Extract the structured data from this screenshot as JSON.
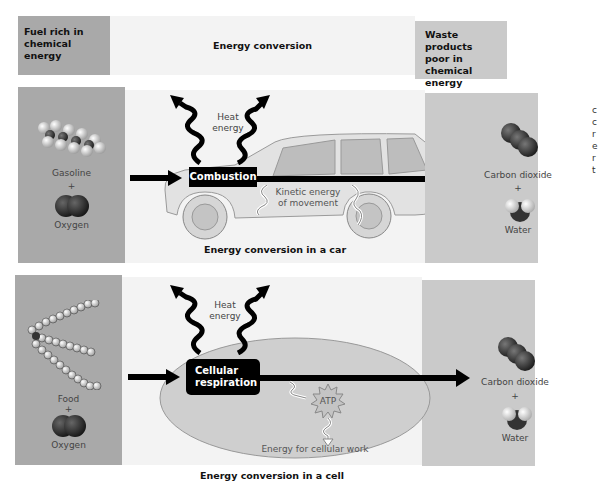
{
  "header": {
    "left": "Fuel rich in chemical energy",
    "left_lines": [
      "Fuel rich in",
      "chemical",
      "energy"
    ],
    "middle": "Energy conversion",
    "right": "Waste products poor in chemical energy",
    "right_lines": [
      "Waste products",
      "poor in chemical",
      "energy"
    ]
  },
  "car_panel": {
    "inputs": {
      "fuel": "Gasoline",
      "plus": "+",
      "oxidant": "Oxygen"
    },
    "heat_label": [
      "Heat",
      "energy"
    ],
    "process": "Combustion",
    "kinetic_label": [
      "Kinetic energy",
      "of movement"
    ],
    "caption": "Energy conversion in a car",
    "outputs": {
      "product1": "Carbon dioxide",
      "plus": "+",
      "product2": "Water"
    }
  },
  "cell_panel": {
    "inputs": {
      "fuel": "Food",
      "plus": "+",
      "oxidant": "Oxygen"
    },
    "heat_label": [
      "Heat",
      "energy"
    ],
    "process": [
      "Cellular",
      "respiration"
    ],
    "atp_label": "ATP",
    "work_label": "Energy for cellular work",
    "caption": "Energy conversion in a cell",
    "outputs": {
      "product1": "Carbon dioxide",
      "plus": "+",
      "product2": "Water"
    }
  },
  "edge_text": [
    "c",
    "c",
    "r",
    "e",
    "r",
    "t"
  ],
  "colors": {
    "left_box": "#a9a9a9",
    "middle_box": "#f3f3f3",
    "right_box": "#cacaca",
    "arrow": "#000000",
    "cell": "#cfcfcf"
  }
}
